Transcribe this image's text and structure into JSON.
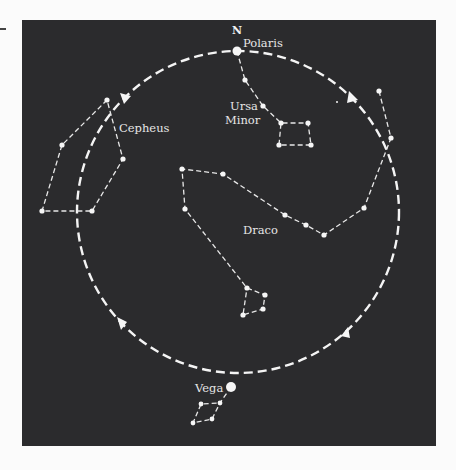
{
  "diagram": {
    "type": "star-chart",
    "direction_label": "N",
    "labels": {
      "polaris": "Polaris",
      "ursa_minor_1": "Ursa",
      "ursa_minor_2": "Minor",
      "cepheus": "Cepheus",
      "draco": "Draco",
      "vega": "Vega"
    },
    "colors": {
      "background": "#2b2b2d",
      "foreground": "#f4f4f4",
      "page": "#fbfbfb"
    },
    "precession_circle": {
      "cx": 238,
      "cy": 212,
      "r": 161,
      "style": "dashed",
      "arrows": 4
    },
    "constellations": [
      {
        "name": "Ursa Minor",
        "stars": [
          [
            237,
            51
          ],
          [
            245,
            80
          ],
          [
            263,
            106
          ],
          [
            281,
            123
          ],
          [
            308,
            123
          ],
          [
            311,
            145
          ],
          [
            279,
            145
          ]
        ]
      },
      {
        "name": "Cepheus",
        "stars": [
          [
            107,
            100
          ],
          [
            62,
            145
          ],
          [
            42,
            211
          ],
          [
            92,
            211
          ],
          [
            123,
            159
          ]
        ]
      },
      {
        "name": "Draco",
        "stars": [
          [
            379,
            91
          ],
          [
            391,
            138
          ],
          [
            364,
            208
          ],
          [
            324,
            235
          ],
          [
            306,
            225
          ],
          [
            285,
            215
          ],
          [
            223,
            174
          ],
          [
            182,
            169
          ],
          [
            185,
            209
          ],
          [
            247,
            288
          ],
          [
            265,
            295
          ],
          [
            263,
            309
          ],
          [
            243,
            315
          ]
        ]
      },
      {
        "name": "Lyra",
        "stars": [
          [
            231,
            387
          ],
          [
            220,
            403
          ],
          [
            201,
            404
          ],
          [
            193,
            423
          ],
          [
            212,
            419
          ]
        ]
      }
    ]
  }
}
